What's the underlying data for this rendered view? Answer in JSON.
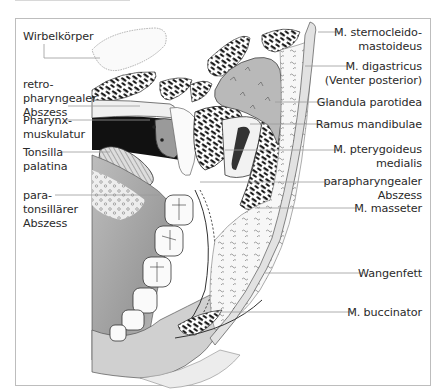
{
  "figure": {
    "colors": {
      "frame_border": "#bdbdbd",
      "label_text": "#2a2a2a",
      "leader_line": "#9a9a9a",
      "gland_fill": "#b9b9b9",
      "dark_cavity": "#111111"
    }
  },
  "labels_left": [
    {
      "id": "wirbelkoerper",
      "lines": [
        "Wirbelkörper"
      ]
    },
    {
      "id": "retropharyngealer-abszess",
      "lines": [
        "retro-",
        "pharyngealer",
        "Abszess"
      ]
    },
    {
      "id": "pharynxmuskulatur",
      "lines": [
        "Pharynx-",
        "muskulatur"
      ]
    },
    {
      "id": "tonsilla-palatina",
      "lines": [
        "Tonsilla",
        "palatina"
      ]
    },
    {
      "id": "paratonsillaerer-abszess",
      "lines": [
        "para-",
        "tonsillärer",
        "Abszess"
      ]
    }
  ],
  "labels_right": [
    {
      "id": "m-sternocleidomastoideus",
      "lines": [
        "M. sternocleido-",
        "mastoideus"
      ]
    },
    {
      "id": "m-digastricus",
      "lines": [
        "M. digastricus",
        "(Venter posterior)"
      ]
    },
    {
      "id": "glandula-parotidea",
      "lines": [
        "Glandula parotidea"
      ]
    },
    {
      "id": "ramus-mandibulae",
      "lines": [
        "Ramus mandibulae"
      ]
    },
    {
      "id": "m-pterygoideus-medialis",
      "lines": [
        "M. pterygoideus",
        "medialis"
      ]
    },
    {
      "id": "parapharyngealer-abszess",
      "lines": [
        "parapharyngealer",
        "Abszess"
      ]
    },
    {
      "id": "m-masseter",
      "lines": [
        "M. masseter"
      ]
    },
    {
      "id": "wangenfett",
      "lines": [
        "Wangenfett"
      ]
    },
    {
      "id": "m-buccinator",
      "lines": [
        "M. buccinator"
      ]
    }
  ]
}
